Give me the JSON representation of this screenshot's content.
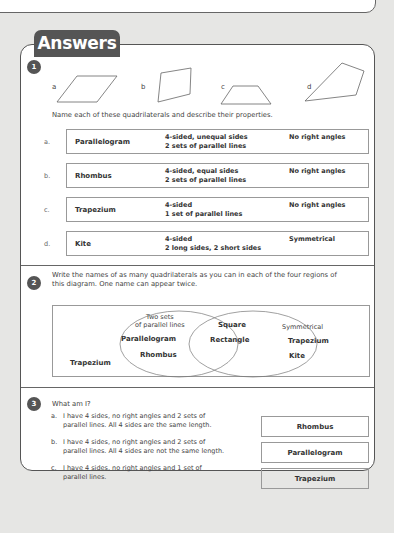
{
  "header": {
    "title": "Answers"
  },
  "q1": {
    "number": "1",
    "shapes": [
      {
        "label": "a",
        "type": "parallelogram"
      },
      {
        "label": "b",
        "type": "rhombus"
      },
      {
        "label": "c",
        "type": "trapezium"
      },
      {
        "label": "d",
        "type": "kite"
      }
    ],
    "instruction": "Name each of these quadrilaterals and describe their properties.",
    "rows": [
      {
        "letter": "a.",
        "name": "Parallelogram",
        "props_line1": "4-sided, unequal sides",
        "props_line2": "2 sets of parallel lines",
        "extra": "No right angles"
      },
      {
        "letter": "b.",
        "name": "Rhombus",
        "props_line1": "4-sided, equal sides",
        "props_line2": "2 sets of parallel lines",
        "extra": "No right angles"
      },
      {
        "letter": "c.",
        "name": "Trapezium",
        "props_line1": "4-sided",
        "props_line2": "1 set of parallel lines",
        "extra": "No right angles"
      },
      {
        "letter": "d.",
        "name": "Kite",
        "props_line1": "4-sided",
        "props_line2": "2 long sides, 2 short sides",
        "extra": "Symmetrical"
      }
    ]
  },
  "q2": {
    "number": "2",
    "instruction_line1": "Write the names of as many quadrilaterals as you can in each of the four regions of",
    "instruction_line2": "this diagram. One name can appear twice.",
    "venn": {
      "left_label_line1": "Two sets",
      "left_label_line2": "of parallel lines",
      "left_items": [
        "Parallelogram",
        "Rhombus"
      ],
      "middle_items": [
        "Square",
        "Rectangle"
      ],
      "right_label": "Symmetrical",
      "right_items": [
        "Trapezium",
        "Kite"
      ],
      "outside_items": [
        "Trapezium"
      ]
    }
  },
  "q3": {
    "number": "3",
    "question": "What am I?",
    "items": [
      {
        "letter": "a.",
        "line1": "I have 4 sides, no right angles and 2 sets of",
        "line2": "parallel lines. All 4 sides are the same length.",
        "answer": "Rhombus"
      },
      {
        "letter": "b.",
        "line1": "I have 4 sides, no right angles and 2 sets of",
        "line2": "parallel lines. All 4 sides are not the same length.",
        "answer": "Parallelogram"
      },
      {
        "letter": "c.",
        "line1": "I have 4 sides, no right angles and 1 set of",
        "line2": "parallel lines.",
        "answer": "Trapezium"
      }
    ]
  }
}
